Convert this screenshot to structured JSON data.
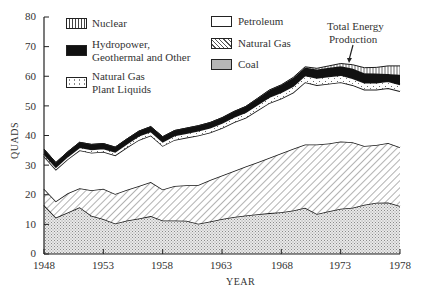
{
  "chart_data": {
    "type": "area",
    "stacked": true,
    "title": "",
    "xlabel": "YEAR",
    "ylabel": "QUADS",
    "xlim": [
      1948,
      1978
    ],
    "ylim": [
      0,
      80
    ],
    "x_ticks": [
      "1948",
      "1953",
      "1958",
      "1963",
      "1968",
      "1973",
      "1978"
    ],
    "y_ticks": [
      "0",
      "10",
      "20",
      "30",
      "40",
      "50",
      "60",
      "70",
      "80"
    ],
    "grid": false,
    "legend_position": "top-left, two columns",
    "annotation": "Total Energy Production",
    "x": [
      1948,
      1949,
      1950,
      1951,
      1952,
      1953,
      1954,
      1955,
      1956,
      1957,
      1958,
      1959,
      1960,
      1961,
      1962,
      1963,
      1964,
      1965,
      1966,
      1967,
      1968,
      1969,
      1970,
      1971,
      1972,
      1973,
      1974,
      1975,
      1976,
      1977,
      1978
    ],
    "series": [
      {
        "name": "Coal",
        "pattern": "dots",
        "values": [
          16.5,
          12.3,
          14.0,
          15.8,
          12.9,
          11.8,
          10.3,
          11.3,
          12.0,
          12.8,
          11.3,
          11.3,
          11.2,
          10.2,
          11.0,
          11.8,
          12.5,
          13.0,
          13.4,
          13.8,
          14.1,
          14.7,
          15.6,
          13.5,
          14.4,
          15.3,
          15.6,
          16.6,
          17.3,
          17.4,
          16.2
        ]
      },
      {
        "name": "Natural Gas",
        "pattern": "diagonal-hatch",
        "values": [
          5.5,
          5.5,
          6.5,
          6.4,
          8.6,
          10.2,
          10.0,
          10.4,
          11.0,
          11.5,
          10.5,
          11.7,
          12.0,
          13.1,
          14.0,
          14.7,
          15.5,
          16.5,
          17.6,
          18.7,
          19.9,
          20.8,
          21.4,
          23.5,
          22.9,
          22.7,
          22.1,
          19.9,
          19.5,
          20.1,
          19.8
        ]
      },
      {
        "name": "Petroleum",
        "pattern": "blank",
        "values": [
          11.0,
          10.7,
          11.5,
          12.8,
          12.7,
          12.5,
          13.0,
          14.3,
          15.5,
          15.7,
          14.7,
          15.5,
          16.1,
          16.7,
          16.0,
          16.0,
          16.5,
          16.5,
          17.5,
          18.5,
          18.5,
          19.0,
          21.0,
          20.0,
          20.2,
          20.0,
          19.3,
          19.0,
          18.7,
          18.5,
          19.0
        ]
      },
      {
        "name": "Natural Gas Plant Liquids",
        "pattern": "sparse-dots",
        "values": [
          0.8,
          0.8,
          0.9,
          1.0,
          1.1,
          1.1,
          1.2,
          1.3,
          1.4,
          1.4,
          1.4,
          1.5,
          1.5,
          1.6,
          1.6,
          1.7,
          1.7,
          1.8,
          1.9,
          2.0,
          2.1,
          2.2,
          2.3,
          2.4,
          2.4,
          2.4,
          2.3,
          2.3,
          2.3,
          2.3,
          2.2
        ]
      },
      {
        "name": "Hydropower, Geothermal and Other",
        "pattern": "solid-black",
        "values": [
          1.6,
          1.6,
          1.6,
          1.7,
          1.7,
          1.7,
          1.6,
          1.6,
          1.6,
          1.6,
          1.7,
          1.7,
          1.7,
          1.7,
          1.8,
          1.8,
          1.9,
          2.0,
          2.1,
          2.3,
          2.4,
          2.7,
          2.7,
          2.9,
          3.0,
          3.0,
          3.3,
          3.2,
          3.1,
          2.5,
          3.3
        ]
      },
      {
        "name": "Nuclear",
        "pattern": "vertical-hatch",
        "values": [
          0,
          0,
          0,
          0,
          0,
          0,
          0,
          0,
          0,
          0,
          0,
          0,
          0,
          0,
          0,
          0,
          0,
          0,
          0.1,
          0.1,
          0.1,
          0.2,
          0.2,
          0.4,
          0.6,
          0.9,
          1.3,
          1.9,
          2.1,
          2.7,
          3.0
        ]
      }
    ],
    "total_energy_production": [
      35.5,
      31.0,
      34.5,
      37.7,
      37.0,
      37.3,
      36.1,
      38.5,
      41.5,
      43.0,
      39.6,
      41.7,
      42.5,
      43.3,
      44.4,
      46.0,
      48.1,
      49.8,
      52.6,
      55.4,
      57.1,
      59.6,
      63.2,
      62.7,
      63.5,
      64.3,
      63.9,
      62.9,
      63.0,
      63.5,
      63.5
    ]
  },
  "legend": {
    "left": [
      {
        "label": "Nuclear",
        "pattern": "vertical-hatch"
      },
      {
        "label_line1": "Hydropower,",
        "label_line2": "Geothermal and Other",
        "pattern": "solid-black"
      },
      {
        "label_line1": "Natural Gas",
        "label_line2": "Plant Liquids",
        "pattern": "sparse-dots"
      }
    ],
    "right": [
      {
        "label": "Petroleum",
        "pattern": "blank"
      },
      {
        "label": "Natural Gas",
        "pattern": "diagonal-hatch"
      },
      {
        "label": "Coal",
        "pattern": "dots"
      }
    ]
  },
  "annotation": {
    "line1": "Total Energy",
    "line2": "Production"
  },
  "axes": {
    "xlabel": "YEAR",
    "ylabel": "QUADS"
  }
}
